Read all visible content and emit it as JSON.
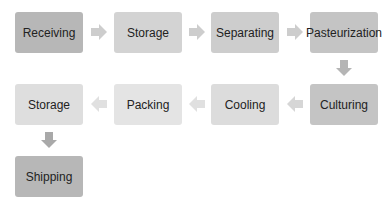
{
  "diagram": {
    "type": "process-flow",
    "steps": [
      {
        "label": "Receiving",
        "shade": "#b7b7b7"
      },
      {
        "label": "Storage",
        "shade": "#d3d3d3"
      },
      {
        "label": "Separating",
        "shade": "#cdcdcd"
      },
      {
        "label": "Pasteurization",
        "shade": "#c4c4c4"
      },
      {
        "label": "Culturing",
        "shade": "#c4c4c4"
      },
      {
        "label": "Cooling",
        "shade": "#dcdcdc"
      },
      {
        "label": "Packing",
        "shade": "#e4e4e4"
      },
      {
        "label": "Storage",
        "shade": "#dedede"
      },
      {
        "label": "Shipping",
        "shade": "#b7b7b7"
      }
    ],
    "arrow_color": "#c8c8c8"
  }
}
